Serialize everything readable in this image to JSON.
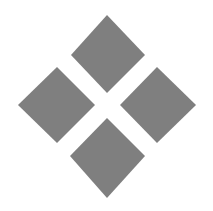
{
  "graphic": {
    "description": "four-diamond-logo",
    "fill_color": "#7f7f7f",
    "background_color": "#ffffff",
    "diamonds": [
      {
        "name": "top",
        "points": "107,15 145,55 107,93 71,55"
      },
      {
        "name": "left",
        "points": "57,67 95,105 57,143 18,105"
      },
      {
        "name": "right",
        "points": "157,67 196,105 157,143 120,105"
      },
      {
        "name": "bottom",
        "points": "107,118 145,156 107,198 70,156"
      }
    ]
  }
}
